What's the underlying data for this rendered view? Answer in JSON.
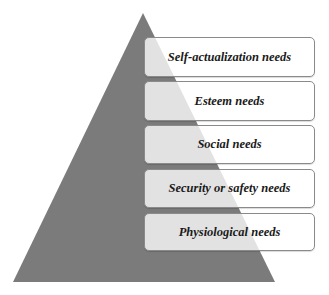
{
  "diagram": {
    "type": "pyramid",
    "pyramid": {
      "fill": "#7b7b7b",
      "apex": [
        143,
        13
      ],
      "base_left": [
        13,
        282
      ],
      "base_right": [
        275,
        282
      ]
    },
    "levels": [
      {
        "label": "Self-actualization needs",
        "top": 37,
        "height": 40
      },
      {
        "label": "Esteem needs",
        "top": 81,
        "height": 40
      },
      {
        "label": "Social needs",
        "top": 125,
        "height": 39
      },
      {
        "label": "Security or safety needs",
        "top": 169,
        "height": 39
      },
      {
        "label": "Physiological needs",
        "top": 213,
        "height": 38
      }
    ]
  }
}
